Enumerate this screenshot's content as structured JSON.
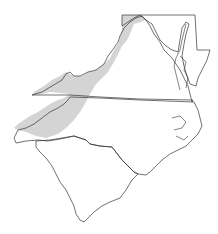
{
  "map": {
    "region": "Mid-Atlantic and Carolinas",
    "states": [
      "Maryland",
      "Delaware",
      "Virginia",
      "North Carolina",
      "South Carolina"
    ],
    "shaded_region": "Appalachian / Blue Ridge belt",
    "colors": {
      "background": "#ffffff",
      "outline": "#333333",
      "shading": "#d4d4d4"
    }
  }
}
